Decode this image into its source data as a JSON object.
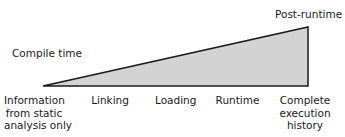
{
  "diagram": {
    "top_left_label": "Compile time",
    "top_right_label": "Post-runtime",
    "fill_color": "#d3d3d3",
    "stroke_color": "#1a1a1a",
    "axis_labels": [
      {
        "line1": "Information",
        "line2": "from static",
        "line3": "analysis only"
      },
      {
        "line1": "Linking"
      },
      {
        "line1": "Loading"
      },
      {
        "line1": "Runtime"
      },
      {
        "line1": "Complete",
        "line2": "execution",
        "line3": "history"
      }
    ]
  }
}
